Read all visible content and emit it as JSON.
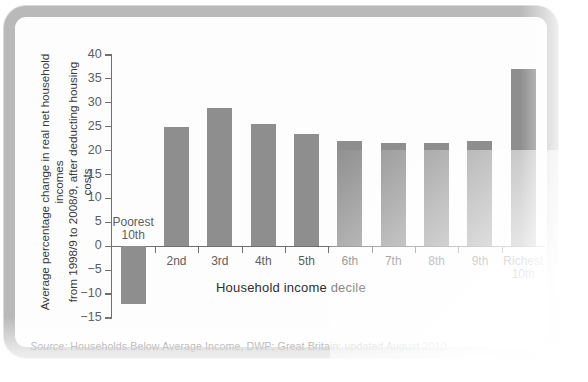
{
  "figure": {
    "y_axis_title": "Average percentage change in real net household incomes\nfrom 1998/9 to 2008/9, after deducting housing costs",
    "x_axis_title": "Household income decile",
    "source_label": "Source:",
    "source_text": "Households Below Average Income, DWP; Great Britain; updated August 2010",
    "bar_color": "#8e8e8e",
    "axis_color": "#6f6f6f",
    "frame_color": "#b9b9b9"
  },
  "chart_data": {
    "type": "bar",
    "title": "",
    "xlabel": "Household income decile",
    "ylabel": "Average percentage change in real net household incomes from 1998/9 to 2008/9, after deducting housing costs",
    "categories": [
      "Poorest\n10th",
      "2nd",
      "3rd",
      "4th",
      "5th",
      "6th",
      "7th",
      "8th",
      "9th",
      "Richest\n10th"
    ],
    "values": [
      -12,
      25,
      29,
      25.5,
      23.5,
      22,
      21.5,
      21.5,
      22,
      37
    ],
    "ylim": [
      -15,
      40
    ],
    "yticks": [
      40,
      35,
      30,
      25,
      20,
      15,
      10,
      5,
      0,
      -5,
      -10,
      -15
    ],
    "ytick_labels": [
      "40",
      "35",
      "30",
      "25",
      "20",
      "15",
      "10",
      "5",
      "0",
      "−5",
      "−10",
      "−15"
    ],
    "grid": false,
    "legend": false
  }
}
